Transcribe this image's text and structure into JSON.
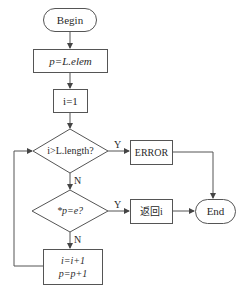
{
  "diagram": {
    "type": "flowchart",
    "nodes": {
      "begin": {
        "label": "Begin",
        "shape": "terminal"
      },
      "init_p": {
        "label": "p=L.elem",
        "shape": "process"
      },
      "init_i": {
        "label": "i=1",
        "shape": "process"
      },
      "check_length": {
        "label": "i>L.length?",
        "shape": "decision"
      },
      "error": {
        "label": "ERROR",
        "shape": "process"
      },
      "check_value": {
        "label": "*p=e?",
        "shape": "decision"
      },
      "return_i": {
        "label": "返回i",
        "shape": "process"
      },
      "end": {
        "label": "End",
        "shape": "terminal"
      },
      "increment": {
        "line1": "i=i+1",
        "line2": "p=p+1",
        "shape": "process"
      }
    },
    "edge_labels": {
      "length_yes": "Y",
      "length_no": "N",
      "value_yes": "Y",
      "value_no": "N"
    },
    "colors": {
      "stroke": "#555555",
      "text": "#2a2a2a",
      "background": "#ffffff"
    }
  }
}
